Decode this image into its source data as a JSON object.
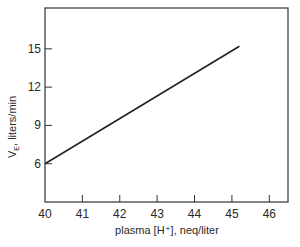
{
  "chart_data": {
    "type": "line",
    "title": "",
    "xlabel": "plasma [H⁺], neq/liter",
    "ylabel": "V_E, liters/min",
    "xlim": [
      40,
      46.5
    ],
    "ylim": [
      3.0,
      18.2
    ],
    "x_ticks": [
      40,
      41,
      42,
      43,
      44,
      45,
      46
    ],
    "y_ticks": [
      6,
      9,
      12,
      15
    ],
    "grid": false,
    "legend": null,
    "series": [
      {
        "name": "V_E vs plasma [H+]",
        "x": [
          40,
          45.2
        ],
        "y": [
          6,
          15.2
        ]
      }
    ]
  },
  "labels": {
    "ylabel_main": "V",
    "ylabel_sub": "E",
    "ylabel_rest": ", liters/min",
    "xlabel": "plasma [H⁺], neq/liter"
  }
}
